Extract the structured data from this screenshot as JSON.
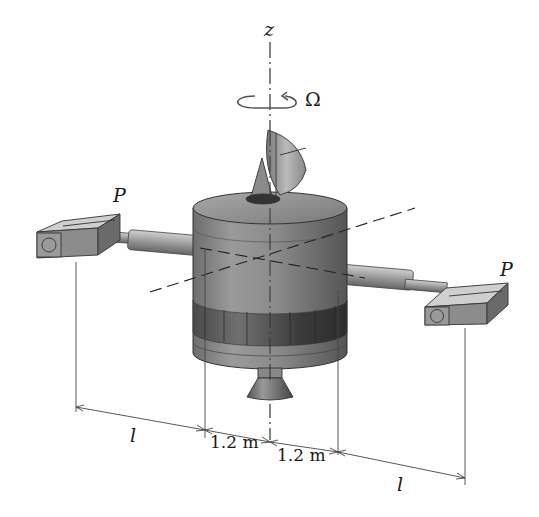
{
  "diagram": {
    "labels": {
      "axis_z": "z",
      "spin_rate": "Ω",
      "load_left": "P",
      "load_right": "P",
      "arm_length_left": "l",
      "arm_length_right": "l",
      "radius_left": "1.2 m",
      "radius_right": "1.2 m"
    },
    "dimensions": {
      "hub_radius_m": 1.2,
      "arm_length_symbol": "l"
    },
    "colors": {
      "body": "#8a8a8a",
      "body_dark": "#4a4a4a",
      "band_dark": "#3c3c3c",
      "line": "#333333",
      "background": "#ffffff"
    }
  }
}
